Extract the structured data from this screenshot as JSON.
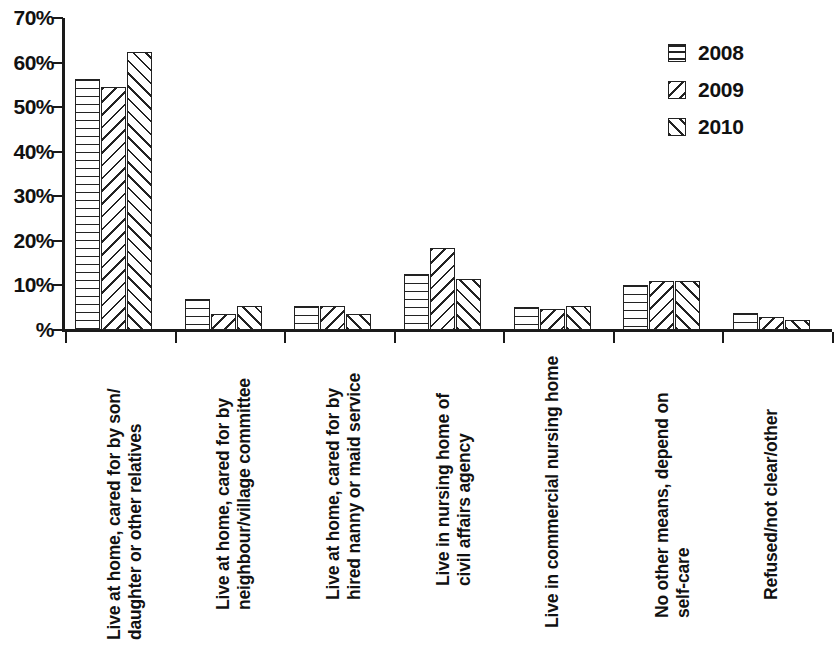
{
  "chart_data": {
    "type": "bar",
    "title": "",
    "subtitle": "",
    "xlabel": "",
    "ylabel": "",
    "ylim": [
      0,
      70
    ],
    "grid": false,
    "legend_position": "top-right",
    "y_tick_labels": [
      "70%",
      "60%",
      "50%",
      "40%",
      "30%",
      "20%",
      "10%",
      "%"
    ],
    "y_tick_values": [
      70,
      60,
      50,
      40,
      30,
      20,
      10,
      0
    ],
    "categories": [
      "Live at home, cared for by son/ daughter or other relatives",
      "Live at home, cared for by neighbour/village committee",
      "Live at home, cared for by hired nanny or maid service",
      "Live in nursing home of civil affairs agency",
      "Live in commercial nursing home",
      "No other means, depend on self-care",
      "Refused/not clear/other"
    ],
    "category_lines": [
      [
        "Live at home, cared for by son/",
        "daughter or other relatives"
      ],
      [
        "Live at home, cared for by",
        "neighbour/village committee"
      ],
      [
        "Live at home, cared for by",
        "hired nanny or maid service"
      ],
      [
        "Live in nursing home of",
        "civil affairs agency"
      ],
      [
        "Live in commercial nursing home"
      ],
      [
        "No other means, depend on",
        "self-care"
      ],
      [
        "Refused/not clear/other"
      ]
    ],
    "series": [
      {
        "name": "2008",
        "pattern": "horizontal-lines",
        "values": [
          56.3,
          6.9,
          5.3,
          12.5,
          5.2,
          10.0,
          3.8
        ]
      },
      {
        "name": "2009",
        "pattern": "backslash-diagonal",
        "values": [
          54.6,
          3.5,
          5.5,
          18.3,
          4.7,
          11.1,
          3.0
        ]
      },
      {
        "name": "2010",
        "pattern": "forwardslash-diagonal",
        "values": [
          62.3,
          5.5,
          3.7,
          11.5,
          5.4,
          11.1,
          2.3
        ]
      }
    ],
    "colors": {
      "axis": "#1a1a1a",
      "bar_outline": "#222222",
      "bar_fill": "#ffffff",
      "hatch": "#222222",
      "background": "#ffffff",
      "text": "#111111"
    }
  },
  "legend": {
    "items": [
      {
        "label": "2008",
        "pattern": "horizontal-lines"
      },
      {
        "label": "2009",
        "pattern": "backslash-diagonal"
      },
      {
        "label": "2010",
        "pattern": "forwardslash-diagonal"
      }
    ]
  }
}
